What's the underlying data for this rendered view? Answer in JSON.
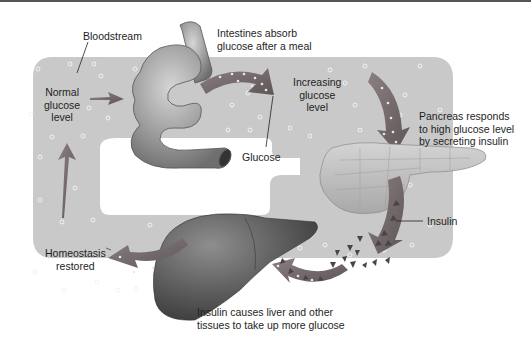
{
  "diagram": {
    "labels": {
      "bloodstream": "Bloodstream",
      "intestines_line1": "Intestines absorb",
      "intestines_line2": "glucose after a meal",
      "normal_line1": "Normal",
      "normal_line2": "glucose",
      "normal_line3": "level",
      "increasing_line1": "Increasing",
      "increasing_line2": "glucose",
      "increasing_line3": "level",
      "pancreas_line1": "Pancreas responds",
      "pancreas_line2": "to high glucose level",
      "pancreas_line3": "by secreting insulin",
      "glucose": "Glucose",
      "insulin": "Insulin",
      "homeostasis_line1": "Homeostasis",
      "homeostasis_line2": "restored",
      "liver_line1": "Insulin causes liver and other",
      "liver_line2": "tissues to take up more glucose"
    },
    "icons": [
      "intestine-icon",
      "pancreas-icon",
      "liver-icon",
      "glucose-dot-icon",
      "insulin-triangle-icon",
      "flow-arrow-icon"
    ],
    "colors": {
      "bloodstream_fill": "#c9c9c9",
      "organ_gray": "#8a8a8a",
      "liver_dark": "#5a5a5a",
      "arrow_fill": "#7a6e70",
      "pancreas_fill": "#c4c4c4",
      "background": "#ffffff"
    }
  }
}
